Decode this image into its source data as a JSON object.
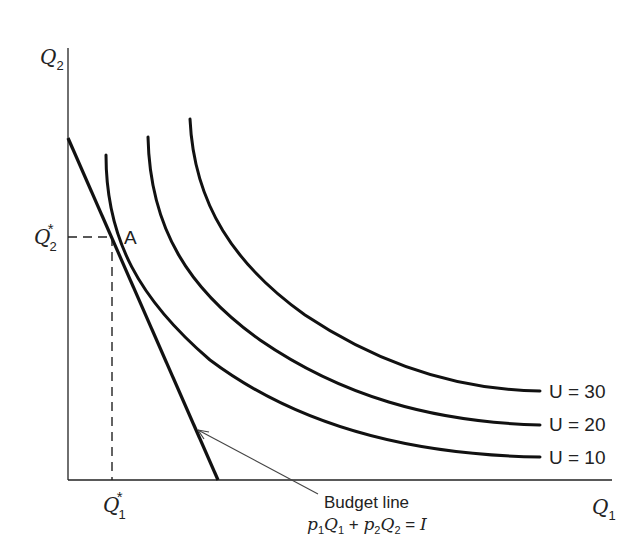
{
  "diagram": {
    "axes": {
      "y_label": "Q",
      "y_label_sub": "2",
      "x_label": "Q",
      "x_label_sub": "1"
    },
    "optimum": {
      "point_label": "A",
      "q2_star": "Q",
      "q2_star_sub": "2",
      "q2_star_sup": "*",
      "q1_star": "Q",
      "q1_star_sub": "1",
      "q1_star_sup": "*"
    },
    "indifference_curves": [
      {
        "label": "U = 10",
        "utility": 10
      },
      {
        "label": "U = 20",
        "utility": 20
      },
      {
        "label": "U = 30",
        "utility": 30
      }
    ],
    "budget_line": {
      "label": "Budget line",
      "equation_p1": "p",
      "equation_p1_sub": "1",
      "equation_q1": "Q",
      "equation_q1_sub": "1",
      "equation_plus": " + ",
      "equation_p2": "p",
      "equation_p2_sub": "2",
      "equation_q2": "Q",
      "equation_q2_sub": "2",
      "equation_eq": " = ",
      "equation_rhs": "I"
    },
    "colors": {
      "ink": "#111111",
      "background": "#ffffff"
    }
  }
}
